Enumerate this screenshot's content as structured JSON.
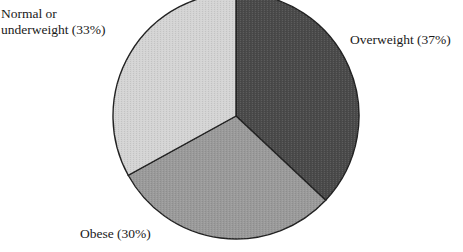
{
  "chart_data": {
    "type": "pie",
    "title": "",
    "categories": [
      "Overweight",
      "Obese",
      "Normal or underweight"
    ],
    "values": [
      37,
      30,
      33
    ],
    "unit": "%",
    "labels": [
      "Overweight (37%)",
      "Obese (30%)",
      "Normal or underweight (33%)"
    ],
    "start_angle_deg": 0,
    "direction": "clockwise",
    "legend": "none (direct labels)",
    "colors": [
      "#4a4a4a",
      "#9a9a9a",
      "#d4d4d4"
    ]
  },
  "labels": {
    "overweight": "Overweight (37%)",
    "obese": "Obese (30%)",
    "normal_line1": "Normal or",
    "normal_line2": "underweight (33%)"
  }
}
